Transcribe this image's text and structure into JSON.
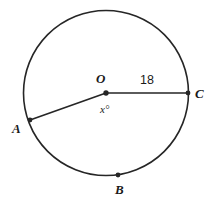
{
  "figure": {
    "stroke_color": "#262626",
    "background_color": "#ffffff",
    "circle": {
      "cx": 106,
      "cy": 93,
      "r": 82.5,
      "stroke_width": 1.6
    },
    "center_point": {
      "x": 106,
      "y": 93,
      "r": 2.6,
      "label": "O"
    },
    "points": [
      {
        "name": "A",
        "x": 30,
        "y": 120,
        "marker": true
      },
      {
        "name": "B",
        "x": 118,
        "y": 175,
        "marker": true
      },
      {
        "name": "C",
        "x": 188,
        "y": 93,
        "marker": true
      }
    ],
    "segments": [
      {
        "name": "OC",
        "from": "O",
        "to": "C",
        "measure": "18"
      },
      {
        "name": "OA",
        "from": "O",
        "to": "A",
        "measure": ""
      }
    ],
    "angle_label": "x°",
    "radius_label": "18"
  },
  "labels": {
    "center": "O",
    "point_a": "A",
    "point_b": "B",
    "point_c": "C",
    "angle": "x°",
    "length_oc": "18"
  }
}
